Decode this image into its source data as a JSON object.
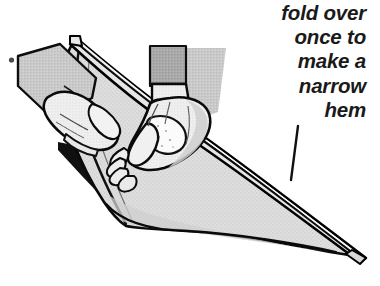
{
  "figure": {
    "title": "fold over once to make a narrow hem",
    "background_color": "#ffffff",
    "width": 380,
    "height": 286
  },
  "caption": {
    "alignment": "right",
    "style": "italic",
    "lines": [
      "fold over",
      "once to",
      "make a",
      "narrow",
      "hem"
    ],
    "text_color": "#1a1a1a"
  },
  "illustration": {
    "description": "Line drawing of two hands folding a diagonal piece of fabric to form a narrow hem along its upper edge",
    "colors": {
      "outline": "#000000",
      "fabric_fill": "#dcdcdc",
      "fabric_shadow": "#c6c6c6",
      "hem_strip_fill": "#e2e2e2",
      "skin_fill": "#f4f4f4",
      "skin_shade": "#d2d2d2",
      "cuff_dark": "#a8a8a8",
      "cuff_light": "#c9c9c9",
      "deep_shadow": "#101010",
      "highlight": "#ffffff"
    },
    "parts": [
      {
        "name": "fabric-sheet",
        "label": "folded fabric"
      },
      {
        "name": "hem-strip",
        "label": "narrow hem fold"
      },
      {
        "name": "left-hand",
        "label": "left hand holding fabric edge"
      },
      {
        "name": "right-hand",
        "label": "right hand pressing the fold"
      },
      {
        "name": "left-sleeve-cuff",
        "label": "left sleeve cuff"
      },
      {
        "name": "right-sleeve-cuff",
        "label": "right sleeve cuff"
      },
      {
        "name": "leader-line",
        "label": "pointer line from hem label to hem"
      }
    ]
  }
}
